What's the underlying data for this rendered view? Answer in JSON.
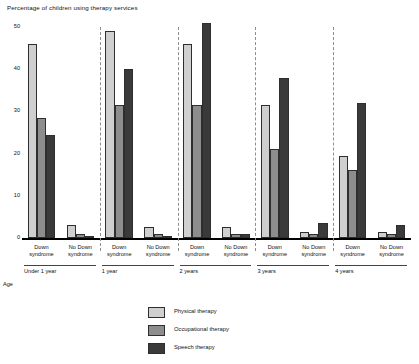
{
  "chart_data": {
    "type": "bar",
    "title": "Percentage of children using therapy services",
    "xlabel": "Age",
    "ylabel": "",
    "ylim": [
      0,
      50
    ],
    "yticks": [
      0,
      10,
      20,
      30,
      40,
      50
    ],
    "grid": false,
    "legend_position": "bottom-center",
    "categories": [
      "Under 1 year / Down syndrome",
      "Under 1 year / No Down syndrome",
      "1 year / Down syndrome",
      "1 year / No Down syndrome",
      "2 years / Down syndrome",
      "2 years / No Down syndrome",
      "3 years / Down syndrome",
      "3 years / No Down syndrome",
      "4 years / Down syndrome",
      "4 years / No Down syndrome"
    ],
    "age_groups": [
      "Under 1 year",
      "1 year",
      "2 years",
      "3 years",
      "4 years"
    ],
    "subgroups": [
      "Down syndrome",
      "No Down syndrome"
    ],
    "series": [
      {
        "name": "Physical therapy",
        "color": "#cfcfcf",
        "values": [
          46,
          3,
          49,
          2.5,
          46,
          2.5,
          31.5,
          1.5,
          19.5,
          1.5
        ]
      },
      {
        "name": "Occupational therapy",
        "color": "#8d8d8d",
        "values": [
          28.5,
          1,
          31.5,
          1,
          31.5,
          1,
          21,
          1,
          16,
          1
        ]
      },
      {
        "name": "Speech therapy",
        "color": "#3a3a3a",
        "values": [
          24.5,
          0.5,
          40,
          0.5,
          51,
          1,
          38,
          3.5,
          32,
          3
        ]
      }
    ]
  },
  "axis": {
    "y_tick_labels": [
      "0",
      "10",
      "20",
      "30",
      "40",
      "50"
    ],
    "x_axis_name": "Age",
    "subgroup_down": "Down syndrome",
    "subgroup_no_down": "No Down syndrome"
  },
  "legend": {
    "items": [
      {
        "label": "Physical therapy",
        "swatch": "pt"
      },
      {
        "label": "Occupational therapy",
        "swatch": "ot"
      },
      {
        "label": "Speech therapy",
        "swatch": "st"
      }
    ]
  }
}
